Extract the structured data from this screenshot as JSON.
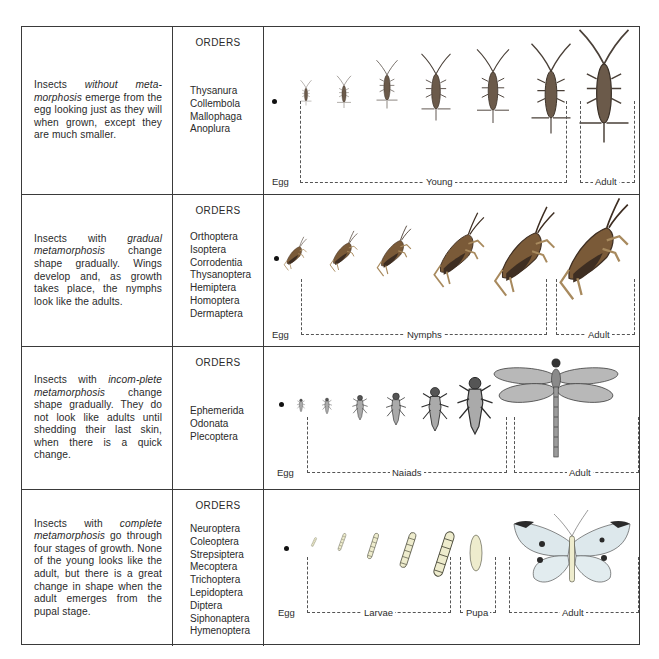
{
  "rows": [
    {
      "id": "ametabolous",
      "description_parts": [
        {
          "text": "Insects ",
          "italic": false
        },
        {
          "text": "without meta-morphosis",
          "italic": true
        },
        {
          "text": " emerge from the egg looking just as they will when grown, except they are much smaller.",
          "italic": false
        }
      ],
      "orders_heading": "ORDERS",
      "orders": [
        "Thysanura",
        "Collembola",
        "Mallophaga",
        "Anoplura"
      ],
      "stages": [
        {
          "label": "Egg"
        },
        {
          "label": "Young"
        },
        {
          "label": "Adult"
        }
      ],
      "illustration": "silverfish-growth-sequence",
      "colors": {
        "body": "#6b5a4a",
        "outline": "#3b3128"
      }
    },
    {
      "id": "gradual",
      "description_parts": [
        {
          "text": "Insects with ",
          "italic": false
        },
        {
          "text": "gradual metamorphosis",
          "italic": true
        },
        {
          "text": " change shape gradually. Wings develop and, as growth takes place, the nymphs look like the adults.",
          "italic": false
        }
      ],
      "orders_heading": "ORDERS",
      "orders": [
        "Orthoptera",
        "Isoptera",
        "Corrodentia",
        "Thysanoptera",
        "Hemiptera",
        "Homoptera",
        "Dermaptera"
      ],
      "stages": [
        {
          "label": "Egg"
        },
        {
          "label": "Nymphs"
        },
        {
          "label": "Adult"
        }
      ],
      "illustration": "grasshopper-growth-sequence",
      "colors": {
        "body": "#7a5a38",
        "dark": "#3e2e22",
        "light": "#a88a5e"
      }
    },
    {
      "id": "incomplete",
      "description_parts": [
        {
          "text": "Insects with ",
          "italic": false
        },
        {
          "text": "incom-plete metamorphosis",
          "italic": true
        },
        {
          "text": " change shape gradually. They do not look like adults until shedding their last skin, when there is a quick change.",
          "italic": false
        }
      ],
      "orders_heading": "ORDERS",
      "orders": [
        "Ephemerida",
        "Odonata",
        "Plecoptera"
      ],
      "stages": [
        {
          "label": "Egg"
        },
        {
          "label": "Naiads"
        },
        {
          "label": "Adult"
        }
      ],
      "illustration": "dragonfly-growth-sequence",
      "colors": {
        "body": "#8a8a8a",
        "outline": "#2e2e2e",
        "wing": "#b8b8b8"
      }
    },
    {
      "id": "complete",
      "description_parts": [
        {
          "text": "Insects with ",
          "italic": false
        },
        {
          "text": "complete metamorphosis",
          "italic": true
        },
        {
          "text": " go through four stages of growth. None of the young looks like the adult, but there is a great change in shape when the adult emerges from the pupal stage.",
          "italic": false
        }
      ],
      "orders_heading": "ORDERS",
      "orders": [
        "Neuroptera",
        "Coleoptera",
        "Strepsiptera",
        "Mecoptera",
        "Trichoptera",
        "Lepidoptera",
        "Diptera",
        "Siphonaptera",
        "Hymenoptera"
      ],
      "stages": [
        {
          "label": "Egg"
        },
        {
          "label": "Larvae"
        },
        {
          "label": "Pupa"
        },
        {
          "label": "Adult"
        }
      ],
      "illustration": "butterfly-growth-sequence",
      "colors": {
        "larva": "#eeeccd",
        "larva_outline": "#4a4a3a",
        "wing": "#dde8ec",
        "wing_tip": "#2a2a2a"
      }
    }
  ]
}
